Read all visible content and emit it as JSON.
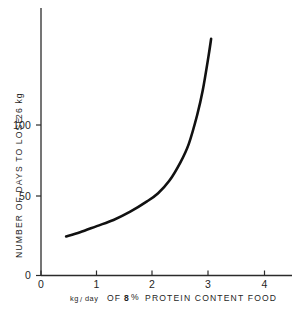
{
  "chart_data": {
    "type": "line",
    "title": "",
    "subtitle": "",
    "xlabel": "kg/day OF 8 % PROTEIN CONTENT FOOD",
    "ylabel": "NUMBER OF DAYS TO LOSE 26 kg",
    "xlim": [
      0,
      4.5
    ],
    "ylim": [
      0,
      130
    ],
    "grid": false,
    "legend": false,
    "legend_position": "none",
    "xticks": [
      "0",
      "1",
      "2",
      "3",
      "4"
    ],
    "xtick_values": [
      0,
      1,
      2,
      3,
      4
    ],
    "yticks": [
      "0",
      "50",
      "100"
    ],
    "ytick_values": [
      0,
      50,
      100
    ],
    "series": [
      {
        "name": "days to lose 26 kg",
        "x": [
          0.45,
          0.7,
          1.0,
          1.3,
          1.6,
          1.9,
          2.1,
          2.3,
          2.5,
          2.65,
          2.8,
          2.9,
          3.0,
          3.05
        ],
        "values": [
          19,
          21,
          24,
          27,
          31,
          36,
          40,
          46,
          55,
          64,
          78,
          90,
          106,
          115
        ]
      }
    ],
    "annotations": []
  },
  "axis_labels": {
    "x_title_part1": "kg",
    "x_title_slash": "/",
    "x_title_part2": "day",
    "x_title_part3": "OF",
    "x_title_number": "8",
    "x_title_percent": "%",
    "x_title_part4": "PROTEIN  CONTENT  FOOD",
    "y_title": "NUMBER  OF  DAYS  TO  LOSE",
    "y_title_value": "26 kg"
  },
  "colors": {
    "background": "#ffffff",
    "axis": "#2b2b2b",
    "curve": "#111111",
    "text": "#1f1f1f"
  }
}
